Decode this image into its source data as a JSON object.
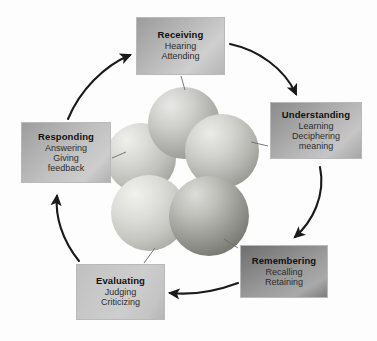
{
  "diagram": {
    "type": "cycle-diagram",
    "background_color": "#fdfdfd",
    "center_graphic": "five-overlapping-spheres-cluster",
    "nodes": [
      {
        "id": "receiving",
        "title": "Receiving",
        "lines": [
          "Hearing",
          "Attending"
        ],
        "order": 1,
        "box_color": "#bdbdbd"
      },
      {
        "id": "understanding",
        "title": "Understanding",
        "lines": [
          "Learning",
          "Deciphering",
          "meaning"
        ],
        "order": 2,
        "box_color": "#b4b4b4"
      },
      {
        "id": "remembering",
        "title": "Remembering",
        "lines": [
          "Recalling",
          "Retaining"
        ],
        "order": 3,
        "box_color": "#8f8f8f"
      },
      {
        "id": "evaluating",
        "title": "Evaluating",
        "lines": [
          "Judging",
          "Criticizing"
        ],
        "order": 4,
        "box_color": "#c9c9c9"
      },
      {
        "id": "responding",
        "title": "Responding",
        "lines": [
          "Answering",
          "Giving",
          "feedback"
        ],
        "order": 5,
        "box_color": "#c0c0c0"
      }
    ],
    "arrows": [
      {
        "from": "receiving",
        "to": "understanding"
      },
      {
        "from": "understanding",
        "to": "remembering"
      },
      {
        "from": "remembering",
        "to": "evaluating"
      },
      {
        "from": "evaluating",
        "to": "responding"
      },
      {
        "from": "responding",
        "to": "receiving"
      }
    ],
    "arrow_color": "#1a1a1a",
    "leader_line_color": "#6b6b6b",
    "spheres": [
      {
        "id": "sphere-top",
        "cx": 184,
        "cy": 123,
        "r": 36
      },
      {
        "id": "sphere-left",
        "cx": 141,
        "cy": 158,
        "r": 35
      },
      {
        "id": "sphere-right",
        "cx": 222,
        "cy": 151,
        "r": 37
      },
      {
        "id": "sphere-bottom-left",
        "cx": 149,
        "cy": 213,
        "r": 38
      },
      {
        "id": "sphere-bottom-right",
        "cx": 209,
        "cy": 216,
        "r": 40
      }
    ]
  }
}
